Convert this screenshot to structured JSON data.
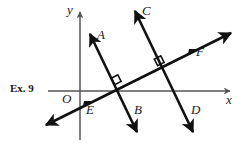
{
  "figure": {
    "exercise_tag": "Ex. 9",
    "background_color": "#ffffff",
    "ink_color": "#111111",
    "axis_color": "#555555",
    "width": 242,
    "height": 147,
    "origin": {
      "x": 80,
      "y": 91
    },
    "axes": {
      "x_axis": {
        "label": "x",
        "label_pos": {
          "x": 228,
          "y": 95
        },
        "start": {
          "x": 48,
          "y": 91
        },
        "end": {
          "x": 232,
          "y": 91
        },
        "arrow": "right"
      },
      "y_axis": {
        "label": "y",
        "label_pos": {
          "x": 67,
          "y": 4
        },
        "start": {
          "x": 80,
          "y": 140
        },
        "end": {
          "x": 80,
          "y": 10
        },
        "arrow": "up"
      },
      "origin_label": "O",
      "origin_label_pos": {
        "x": 62,
        "y": 94
      }
    },
    "lines": [
      {
        "name": "line-AB",
        "endpoint_labels": [
          "A",
          "B"
        ],
        "from": {
          "x": 88,
          "y": 30
        },
        "to": {
          "x": 139,
          "y": 136
        },
        "double_arrow": true,
        "label_A_pos": {
          "x": 98,
          "y": 29
        },
        "label_B_pos": {
          "x": 135,
          "y": 105
        }
      },
      {
        "name": "line-CD",
        "endpoint_labels": [
          "C",
          "D"
        ],
        "from": {
          "x": 133,
          "y": 7
        },
        "to": {
          "x": 195,
          "y": 136
        },
        "double_arrow": true,
        "label_C_pos": {
          "x": 143,
          "y": 6
        },
        "label_D_pos": {
          "x": 192,
          "y": 105
        }
      },
      {
        "name": "line-EF",
        "endpoint_labels": [
          "E",
          "F"
        ],
        "from": {
          "x": 44,
          "y": 126
        },
        "to": {
          "x": 233,
          "y": 32
        },
        "double_arrow": true,
        "label_E_pos": {
          "x": 87,
          "y": 104
        },
        "label_F_pos": {
          "x": 197,
          "y": 46
        }
      }
    ],
    "intersections": [
      {
        "name": "intersection-AB-EF",
        "point": {
          "x": 117,
          "y": 91
        },
        "right_angle_marker": true
      },
      {
        "name": "intersection-CD-EF",
        "point": {
          "x": 160,
          "y": 72
        },
        "right_angle_marker": true
      }
    ],
    "point_labels": [
      {
        "id": "A",
        "text": "A"
      },
      {
        "id": "B",
        "text": "B"
      },
      {
        "id": "C",
        "text": "C"
      },
      {
        "id": "D",
        "text": "D"
      },
      {
        "id": "E",
        "text": "E"
      },
      {
        "id": "F",
        "text": "F"
      },
      {
        "id": "O",
        "text": "O"
      },
      {
        "id": "x",
        "text": "x"
      },
      {
        "id": "y",
        "text": "y"
      }
    ]
  }
}
